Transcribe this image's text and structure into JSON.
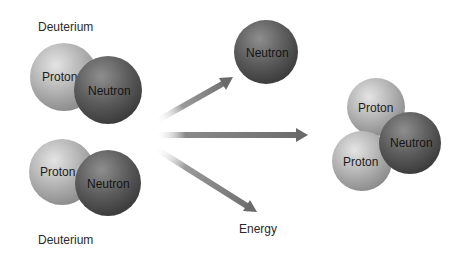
{
  "diagram": {
    "title_top": "Deuterium",
    "title_bottom": "Deuterium",
    "energy_label": "Energy",
    "deuterium_top": {
      "proton_label": "Proton",
      "neutron_label": "Neutron"
    },
    "deuterium_bottom": {
      "proton_label": "Proton",
      "neutron_label": "Neutron"
    },
    "free_neutron": {
      "label": "Neutron"
    },
    "helium_nucleus": {
      "proton1_label": "Proton",
      "proton2_label": "Proton",
      "neutron_label": "Neutron"
    },
    "colors": {
      "proton": "#a8a8a8",
      "neutron": "#5e5e5e",
      "arrow": "#707070",
      "text": "#2a2a2a",
      "background": "#ffffff"
    }
  }
}
